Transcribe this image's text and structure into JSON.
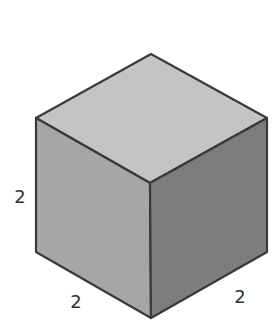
{
  "diagram": {
    "type": "isometric-cube",
    "colors": {
      "top_face": "#c4c4c4",
      "left_face": "#a6a6a6",
      "right_face": "#7d7d7d",
      "edge": "#3a3a3a",
      "label": "#333333"
    },
    "faces": {
      "top": "151,54 267,118 150,183 36,118",
      "left": "36,118 150,183 151,318 36,252",
      "right": "150,183 267,118 267,252 151,318"
    },
    "labels": {
      "height": "2",
      "depth": "2",
      "width": "2"
    }
  }
}
